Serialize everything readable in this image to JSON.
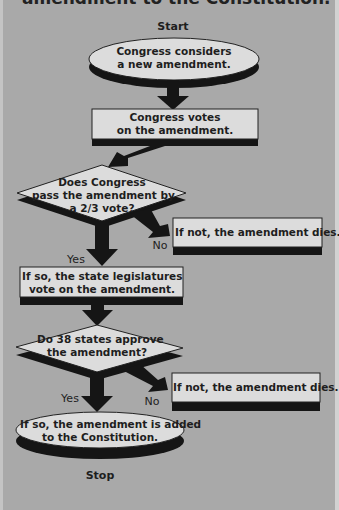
{
  "title": "amendment to the Constitution.",
  "colors": {
    "background": "#a9a9a9",
    "shape_fill": "#dcdcdc",
    "shadow": "#151515",
    "text": "#1e1e1e"
  },
  "flow": {
    "start_label": "Start",
    "stop_label": "Stop",
    "step1": "Congress considers\na new amendment.",
    "step1_line1": "Congress considers",
    "step1_line2": "a new amendment.",
    "step2_line1": "Congress votes",
    "step2_line2": "on the amendment.",
    "decision1_line1": "Does Congress",
    "decision1_line2": "pass the amendment by",
    "decision1_line3": "a 2/3 vote?",
    "no1_box": "If not, the amendment dies.",
    "no1_label": "No",
    "yes1_label": "Yes",
    "step3_line1": "If so, the state legislatures",
    "step3_line2": "vote on the amendment.",
    "decision2_line1": "Do 38 states approve",
    "decision2_line2": "the amendment?",
    "no2_box": "If not, the amendment dies.",
    "no2_label": "No",
    "yes2_label": "Yes",
    "end_line1": "If so, the amendment is added",
    "end_line2": "to the Constitution."
  }
}
